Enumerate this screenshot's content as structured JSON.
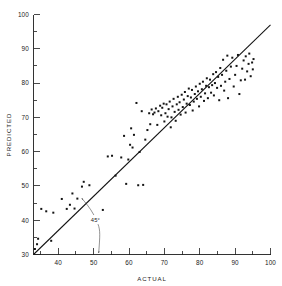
{
  "chart_data": {
    "type": "scatter",
    "title": "",
    "xlabel": "ACTUAL",
    "ylabel": "PREDICTED",
    "xlim": [
      33,
      100
    ],
    "ylim": [
      30,
      100
    ],
    "x_ticks": [
      40,
      50,
      60,
      70,
      80,
      90,
      100
    ],
    "x_tick_labels": [
      "40",
      "50",
      "60",
      "70",
      "80",
      "90",
      "100"
    ],
    "x_minor_step": 5,
    "y_ticks": [
      30,
      40,
      50,
      60,
      70,
      80,
      90,
      100
    ],
    "y_tick_labels": [
      "30",
      "40",
      "50",
      "60",
      "70",
      "80",
      "90",
      "100"
    ],
    "y_minor_step": 5,
    "grid": false,
    "legend": false,
    "frame": "left-bottom",
    "annotations": [
      {
        "text": "45°",
        "x": 50.5,
        "y": 40.2,
        "describes": "reference-line-angle"
      }
    ],
    "reference_line": {
      "label": "45° line of equality",
      "from": [
        33,
        30
      ],
      "to": [
        100,
        97
      ],
      "style": "solid"
    },
    "marker": "filled-square",
    "marker_color": "#141414",
    "n_points": 131,
    "points": [
      [
        33.4,
        31.6
      ],
      [
        34.0,
        33.0
      ],
      [
        34.3,
        34.6
      ],
      [
        35.2,
        43.3
      ],
      [
        36.6,
        42.6
      ],
      [
        38.0,
        34.0
      ],
      [
        38.6,
        42.2
      ],
      [
        41.0,
        46.2
      ],
      [
        42.4,
        43.3
      ],
      [
        43.3,
        44.5
      ],
      [
        44.0,
        47.8
      ],
      [
        44.6,
        43.4
      ],
      [
        45.4,
        46.3
      ],
      [
        46.7,
        49.8
      ],
      [
        47.2,
        51.2
      ],
      [
        48.8,
        50.2
      ],
      [
        52.6,
        43.0
      ],
      [
        54.0,
        58.6
      ],
      [
        55.2,
        58.8
      ],
      [
        56.2,
        53.0
      ],
      [
        57.8,
        58.3
      ],
      [
        58.6,
        64.6
      ],
      [
        59.2,
        50.6
      ],
      [
        59.8,
        57.7
      ],
      [
        60.3,
        62.0
      ],
      [
        60.6,
        66.8
      ],
      [
        61.0,
        61.2
      ],
      [
        61.4,
        64.9
      ],
      [
        62.1,
        74.2
      ],
      [
        62.6,
        50.2
      ],
      [
        63.0,
        59.9
      ],
      [
        63.6,
        71.8
      ],
      [
        64.0,
        50.3
      ],
      [
        64.6,
        63.5
      ],
      [
        65.2,
        66.3
      ],
      [
        65.7,
        71.2
      ],
      [
        66.0,
        68.0
      ],
      [
        66.4,
        72.3
      ],
      [
        66.8,
        70.9
      ],
      [
        67.2,
        71.4
      ],
      [
        67.6,
        72.6
      ],
      [
        68.0,
        67.8
      ],
      [
        68.3,
        71.8
      ],
      [
        68.8,
        73.4
      ],
      [
        69.1,
        70.6
      ],
      [
        69.4,
        72.8
      ],
      [
        69.8,
        74.0
      ],
      [
        70.0,
        68.8
      ],
      [
        70.3,
        71.2
      ],
      [
        70.6,
        73.8
      ],
      [
        70.9,
        70.2
      ],
      [
        71.2,
        72.4
      ],
      [
        71.5,
        74.6
      ],
      [
        71.8,
        67.1
      ],
      [
        72.0,
        70.0
      ],
      [
        72.3,
        73.2
      ],
      [
        72.6,
        75.4
      ],
      [
        72.9,
        71.6
      ],
      [
        73.2,
        69.0
      ],
      [
        73.5,
        73.8
      ],
      [
        73.8,
        76.0
      ],
      [
        74.0,
        72.2
      ],
      [
        74.3,
        74.4
      ],
      [
        74.6,
        70.8
      ],
      [
        74.9,
        76.6
      ],
      [
        75.2,
        73.0
      ],
      [
        75.5,
        75.2
      ],
      [
        75.8,
        77.4
      ],
      [
        76.0,
        71.4
      ],
      [
        76.3,
        74.0
      ],
      [
        76.6,
        76.2
      ],
      [
        76.9,
        78.4
      ],
      [
        77.2,
        73.6
      ],
      [
        77.5,
        75.8
      ],
      [
        77.8,
        78.0
      ],
      [
        78.0,
        72.0
      ],
      [
        78.3,
        74.6
      ],
      [
        78.6,
        76.8
      ],
      [
        78.9,
        79.0
      ],
      [
        79.2,
        75.4
      ],
      [
        79.5,
        77.6
      ],
      [
        79.8,
        73.2
      ],
      [
        80.0,
        79.8
      ],
      [
        80.3,
        76.0
      ],
      [
        80.6,
        78.2
      ],
      [
        80.9,
        80.4
      ],
      [
        81.2,
        74.8
      ],
      [
        81.5,
        77.0
      ],
      [
        81.8,
        79.2
      ],
      [
        82.0,
        81.4
      ],
      [
        82.3,
        75.6
      ],
      [
        82.6,
        78.8
      ],
      [
        82.9,
        81.0
      ],
      [
        83.2,
        77.2
      ],
      [
        83.5,
        79.4
      ],
      [
        83.8,
        82.6
      ],
      [
        84.0,
        76.4
      ],
      [
        84.3,
        80.0
      ],
      [
        84.6,
        83.2
      ],
      [
        84.9,
        78.6
      ],
      [
        85.2,
        81.8
      ],
      [
        85.5,
        75.0
      ],
      [
        85.8,
        84.4
      ],
      [
        86.0,
        79.2
      ],
      [
        86.3,
        82.4
      ],
      [
        86.6,
        86.8
      ],
      [
        86.9,
        77.8
      ],
      [
        87.2,
        80.4
      ],
      [
        87.5,
        83.6
      ],
      [
        87.8,
        88.0
      ],
      [
        88.0,
        75.6
      ],
      [
        88.4,
        81.2
      ],
      [
        88.8,
        84.8
      ],
      [
        89.2,
        87.4
      ],
      [
        89.6,
        79.0
      ],
      [
        90.0,
        82.4
      ],
      [
        90.4,
        85.0
      ],
      [
        90.8,
        88.2
      ],
      [
        91.2,
        76.8
      ],
      [
        91.6,
        80.8
      ],
      [
        92.0,
        84.2
      ],
      [
        92.4,
        86.6
      ],
      [
        92.8,
        81.0
      ],
      [
        93.0,
        87.8
      ],
      [
        93.4,
        83.4
      ],
      [
        93.8,
        85.6
      ],
      [
        94.0,
        88.6
      ],
      [
        94.4,
        82.0
      ],
      [
        94.8,
        86.0
      ],
      [
        95.0,
        84.0
      ],
      [
        95.2,
        87.0
      ]
    ]
  }
}
